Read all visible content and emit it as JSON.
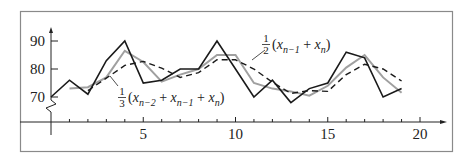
{
  "chart_data": {
    "type": "line",
    "title": "",
    "xlabel": "",
    "ylabel": "",
    "xlim": [
      0,
      20
    ],
    "ylim": [
      70,
      90
    ],
    "y_axis_break": true,
    "grid": false,
    "x_ticks": [
      5,
      10,
      15,
      20
    ],
    "x_minor_ticks": [
      1,
      2,
      3,
      4,
      6,
      7,
      8,
      9,
      11,
      12,
      13,
      14,
      16,
      17,
      18,
      19
    ],
    "y_ticks": [
      70,
      80,
      90
    ],
    "series": [
      {
        "name": "x_n (data)",
        "style": "solid-black",
        "x": [
          0,
          1,
          2,
          3,
          4,
          5,
          6,
          7,
          8,
          9,
          10,
          11,
          12,
          13,
          14,
          15,
          16,
          17,
          18,
          19
        ],
        "values": [
          70,
          76,
          71,
          83,
          90,
          75,
          76,
          80,
          80,
          90,
          80,
          70,
          76,
          68,
          73,
          75,
          86,
          84,
          70,
          73
        ]
      },
      {
        "name": "1/2(x_{n-1} + x_n)",
        "style": "solid-gray",
        "x": [
          1,
          2,
          3,
          4,
          5,
          6,
          7,
          8,
          9,
          10,
          11,
          12,
          13,
          14,
          15,
          16,
          17,
          18,
          19
        ],
        "values": [
          73,
          73.5,
          77,
          86.5,
          82.5,
          75.5,
          78,
          80,
          85,
          85,
          75,
          73,
          72,
          70.5,
          74,
          80.5,
          85,
          77,
          71.5
        ]
      },
      {
        "name": "1/3(x_{n-2} + x_{n-1} + x_n)",
        "style": "dashed-black",
        "x": [
          2,
          3,
          4,
          5,
          6,
          7,
          8,
          9,
          10,
          11,
          12,
          13,
          14,
          15,
          16,
          17,
          18,
          19
        ],
        "values": [
          72.3,
          76.7,
          81.3,
          82.7,
          80.3,
          77,
          78.7,
          83.3,
          83.3,
          80,
          75.3,
          71.3,
          72.3,
          72,
          78,
          81.7,
          80,
          75.7
        ]
      }
    ],
    "annotations": [
      {
        "label": "1/2(x_{n-1} + x_n)",
        "frac_num": "1",
        "frac_den": "2",
        "body": "(x",
        "sub1": "n−1",
        "plus": " + x",
        "sub2": "n",
        "close": ")",
        "points_to": "gray line"
      },
      {
        "label": "1/3(x_{n-2} + x_{n-1} + x_n)",
        "frac_num": "1",
        "frac_den": "3",
        "body": "(x",
        "sub1": "n−2",
        "plus": " + x",
        "sub2": "n−1",
        "plus2": " + x",
        "sub3": "n",
        "close": ")",
        "points_to": "dashed line"
      }
    ]
  },
  "colors": {
    "frame": "#8a8a8a",
    "data_line": "#1a1a1a",
    "avg2_line": "#a0a0a0",
    "avg3_line": "#1a1a1a",
    "axis": "#222222"
  }
}
